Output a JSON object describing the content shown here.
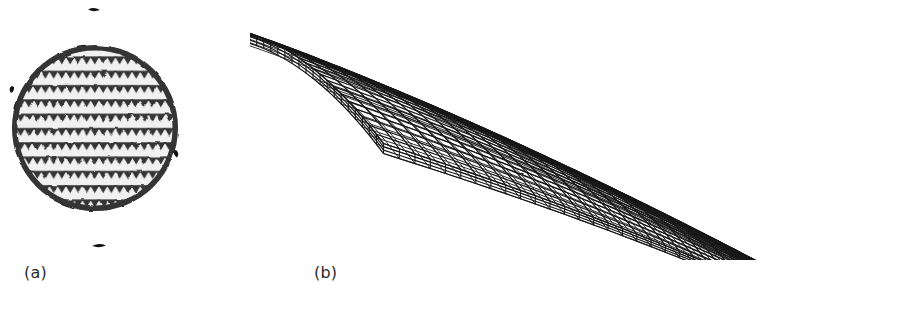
{
  "figure": {
    "background_color": "#ffffff",
    "ink_color": "#1a1a1a",
    "width": 918,
    "height": 311,
    "panels": [
      {
        "id": "a",
        "caption": "(a)",
        "kind": "photograph",
        "subject": "circular isogrid lattice disc",
        "description": "Dark circular disc with an equilateral triangular (isogrid) rib lattice; light triangular pockets between thick black ribs.",
        "geometry": {
          "center_x": 95,
          "center_y": 128,
          "radius": 83,
          "rim_thickness": 7,
          "lattice_type": "triangular-isogrid",
          "cell_pitch_x": 16.5,
          "cell_pitch_y": 14.3,
          "rib_thickness": 3.4,
          "pocket_corner_radius": 2.2
        }
      },
      {
        "id": "b",
        "caption": "(b)",
        "kind": "wireframe",
        "subject": "3D finite-element mesh of a curved tapering shell",
        "description": "Isometric wireframe of a doubly curved plate of finite thickness; quadrilateral surface mesh on top, ruled side and end faces, tapering to a narrow tip at the right.",
        "geometry": {
          "grid_rows": 22,
          "grid_cols": 34,
          "thickness_layers": 3,
          "left_corner": [
            60,
            32
          ],
          "right_tip": [
            660,
            225
          ],
          "front_corner": [
            355,
            215
          ],
          "back_corner": [
            560,
            22
          ]
        }
      }
    ]
  },
  "captions": {
    "a": "(a)",
    "b": "(b)"
  },
  "colors": {
    "background": "#ffffff",
    "ink": "#1a1a1a",
    "caption": "#2b2b2b",
    "lattice_fill": "#111111",
    "pocket_fill": "#efefef"
  }
}
